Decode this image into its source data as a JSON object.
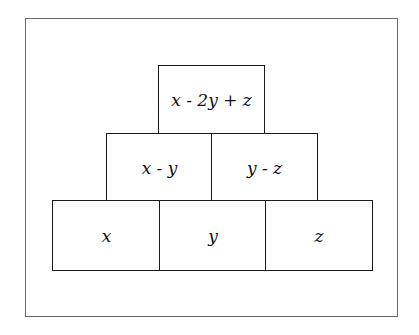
{
  "diagram": {
    "type": "number-pyramid",
    "rows": [
      {
        "level": "top",
        "cells": [
          {
            "label": "x - 2y + z"
          }
        ]
      },
      {
        "level": "middle",
        "cells": [
          {
            "label": "x - y"
          },
          {
            "label": "y - z"
          }
        ]
      },
      {
        "level": "bottom",
        "cells": [
          {
            "label": "x"
          },
          {
            "label": "y"
          },
          {
            "label": "z"
          }
        ]
      }
    ],
    "colors": {
      "line": "#1a1a1a",
      "frame": "#6a6a6a",
      "background": "#ffffff"
    }
  }
}
